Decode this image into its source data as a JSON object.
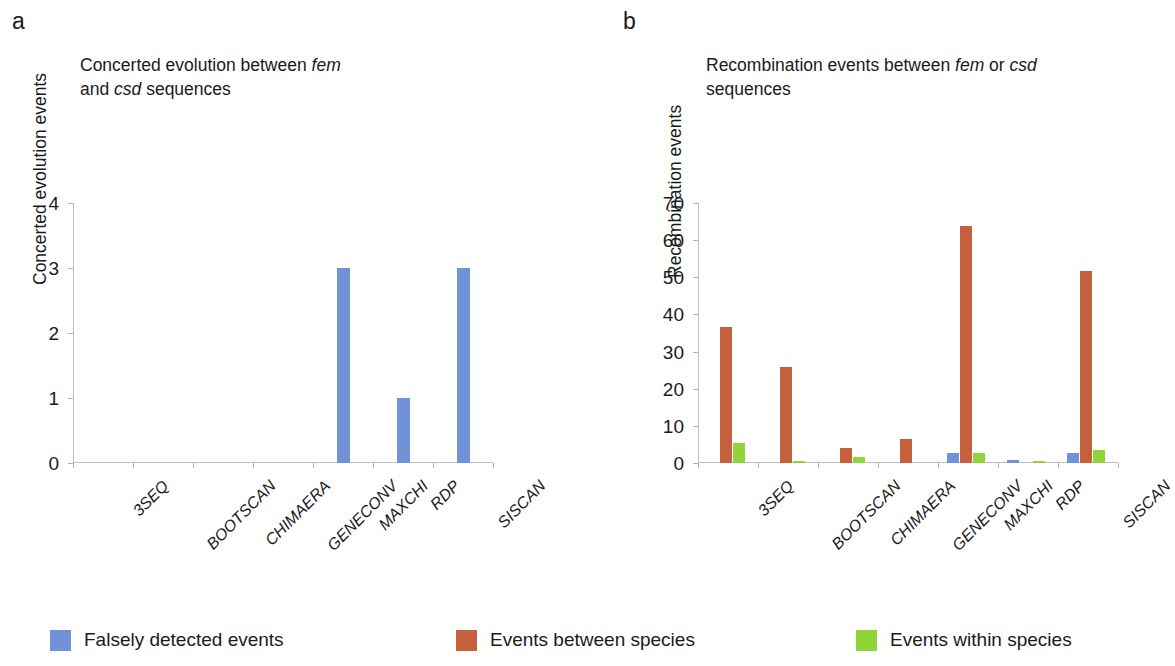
{
  "figure": {
    "panels": [
      {
        "letter": "a",
        "title_line1_pre": "Concerted evolution between ",
        "title_line1_em": "fem",
        "title_line2_pre": "and ",
        "title_line2_em": "csd",
        "title_line2_post": " sequences",
        "ylabel": "Concerted evolution events"
      },
      {
        "letter": "b",
        "title_line1_pre": "Recombination events between ",
        "title_line1_em": "fem",
        "title_line1_mid": " or ",
        "title_line1_em2": "csd",
        "title_line2_post": "sequences",
        "ylabel": "Recombination events"
      }
    ]
  },
  "legend": {
    "position": "bottom",
    "items": [
      {
        "label": "Falsely detected events",
        "color": "#6f93d6",
        "swatch_name": "legend-swatch-falsely-detected"
      },
      {
        "label": "Events between species",
        "color": "#c4613c",
        "swatch_name": "legend-swatch-between-species"
      },
      {
        "label": "Events within species",
        "color": "#91d43a",
        "swatch_name": "legend-swatch-within-species"
      }
    ]
  },
  "chart_data": [
    {
      "type": "bar",
      "panel": "a",
      "title": "Concerted evolution between fem and csd sequences",
      "xlabel": "",
      "ylabel": "Concerted evolution events",
      "categories": [
        "3SEQ",
        "BOOTSCAN",
        "CHIMAERA",
        "GENECONV",
        "MAXCHI",
        "RDP",
        "SISCAN"
      ],
      "series": [
        {
          "name": "Falsely detected events",
          "color": "#6f93d6",
          "values": [
            0,
            0,
            0,
            0,
            3,
            1,
            3
          ]
        }
      ],
      "ylim": [
        0,
        4
      ],
      "yticks": [
        "0",
        "1",
        "2",
        "3",
        "4"
      ],
      "grid": false,
      "legend_position": "bottom"
    },
    {
      "type": "bar",
      "panel": "b",
      "title": "Recombination events between fem or csd sequences",
      "xlabel": "",
      "ylabel": "Recombination events",
      "categories": [
        "3SEQ",
        "BOOTSCAN",
        "CHIMAERA",
        "GENECONV",
        "MAXCHI",
        "RDP",
        "SISCAN"
      ],
      "series": [
        {
          "name": "Falsely detected events",
          "color": "#6f93d6",
          "values": [
            0,
            0,
            0,
            0,
            2.8,
            0.7,
            2.7
          ]
        },
        {
          "name": "Events between species",
          "color": "#c4613c",
          "values": [
            36.7,
            25.8,
            4,
            6.6,
            63.8,
            0,
            51.6
          ]
        },
        {
          "name": "Events within species",
          "color": "#91d43a",
          "values": [
            5.4,
            0.6,
            1.6,
            0,
            2.6,
            0.5,
            3.4
          ]
        }
      ],
      "ylim": [
        0,
        70
      ],
      "yticks": [
        "0",
        "10",
        "20",
        "30",
        "40",
        "50",
        "60",
        "70"
      ],
      "grid": false,
      "legend_position": "bottom"
    }
  ]
}
